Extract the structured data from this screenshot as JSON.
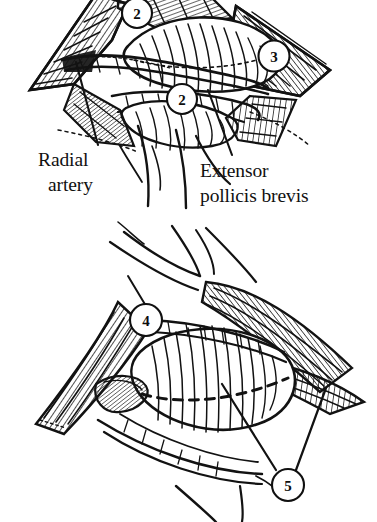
{
  "figure": {
    "style": "pen-and-ink line engraving, black on white",
    "background_color": "#ffffff",
    "ink_color": "#121212",
    "panels": [
      {
        "id": "upper-panel",
        "name": "upper-exposure-view",
        "description": "Diamond-shaped retracted wound over the radial wrist with hatched skin flaps, exposed tendon bellies and underlying vessel",
        "markers": [
          "2",
          "3",
          "2"
        ],
        "labels": [
          "Radial artery",
          "Extensor pollicis brevis"
        ]
      },
      {
        "id": "lower-panel",
        "name": "lower-exposure-view",
        "description": "Deeper diamond-shaped exposure showing muscle belly with dashed incision line",
        "markers": [
          "4",
          "5"
        ],
        "labels": []
      }
    ]
  },
  "markers": [
    {
      "id": "m-top-2",
      "label": "2",
      "cx": 137,
      "cy": 13,
      "r": 15,
      "panel": "upper"
    },
    {
      "id": "m-right-3",
      "label": "3",
      "cx": 274,
      "cy": 56,
      "r": 15.5,
      "panel": "upper"
    },
    {
      "id": "m-mid-2",
      "label": "2",
      "cx": 182,
      "cy": 99,
      "r": 15,
      "panel": "upper"
    },
    {
      "id": "m-low-4",
      "label": "4",
      "cx": 146,
      "cy": 320,
      "r": 16,
      "panel": "lower"
    },
    {
      "id": "m-low-5",
      "label": "5",
      "cx": 288,
      "cy": 485,
      "r": 16,
      "panel": "lower"
    }
  ],
  "text_labels": [
    {
      "id": "label-radial-artery",
      "name": "radial-artery-label",
      "lines": [
        "Radial",
        "artery"
      ],
      "x": 38,
      "y_first": 166,
      "line_height": 25,
      "leader": {
        "from_x": 98,
        "from_y": 145,
        "to_x": 76,
        "to_y": 62
      }
    },
    {
      "id": "label-extensor-pollicis-brevis",
      "name": "extensor-pollicis-brevis-label",
      "lines": [
        "Extensor",
        "pollicis brevis"
      ],
      "x": 200,
      "y_first": 177,
      "line_height": 25,
      "leader": {
        "from_x": 232,
        "from_y": 155,
        "to_x": 208,
        "to_y": 90
      }
    }
  ],
  "annotations": {
    "dashed_incision_present": true,
    "dashed_incision_panel": "lower-panel",
    "dashed_incision_note": "Dashed line marking the planned incision across the exposed muscle belly"
  }
}
